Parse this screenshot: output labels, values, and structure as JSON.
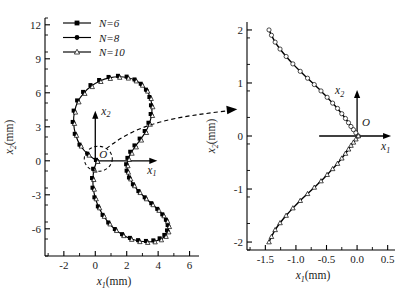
{
  "figure": {
    "kind": "two-panel-trajectory-plot",
    "panels": [
      "left-full-orbit",
      "right-zoom-detail"
    ],
    "callout": {
      "name": "zoom-callout",
      "description": "dashed ellipse around origin in left panel with dashed arrow pointing to right panel"
    }
  },
  "legend": {
    "position": "top-left-inside",
    "entries": [
      {
        "label": "N=6",
        "marker": "filled-square",
        "color": "#000000"
      },
      {
        "label": "N=8",
        "marker": "filled-circle",
        "color": "#000000"
      },
      {
        "label": "N=10",
        "marker": "open-triangle",
        "color": "#000000"
      }
    ]
  },
  "left_panel": {
    "xlabel": "x",
    "xlabel_sub": "1",
    "xlabel_unit": "(mm)",
    "ylabel": "x",
    "ylabel_sub": "2",
    "ylabel_unit": "(mm)",
    "xticks": [
      "-2",
      "0",
      "2",
      "4",
      "6"
    ],
    "yticks": [
      "12",
      "9",
      "6",
      "3",
      "0",
      "-3",
      "-6"
    ],
    "origin_label": "O",
    "inner_axis_x": "x",
    "inner_axis_x_sub": "1",
    "inner_axis_y": "x",
    "inner_axis_y_sub": "2"
  },
  "right_panel": {
    "xlabel": "x",
    "xlabel_sub": "1",
    "xlabel_unit": "(mm)",
    "ylabel": "x",
    "ylabel_sub": "2",
    "ylabel_unit": "(mm)",
    "xticks": [
      "-1.5",
      "-1.0",
      "-0.5",
      "0.0",
      "0.5"
    ],
    "yticks": [
      "2",
      "1",
      "0",
      "-1",
      "-2"
    ],
    "origin_label": "O",
    "inner_axis_x": "x",
    "inner_axis_x_sub": "1",
    "inner_axis_y": "x",
    "inner_axis_y_sub": "2"
  },
  "chart_data": [
    {
      "type": "line",
      "name": "left-full-orbit",
      "title": "",
      "xlabel": "x1 (mm)",
      "ylabel": "x2 (mm)",
      "xlim": [
        -3.2,
        6.6
      ],
      "ylim": [
        -8.4,
        12.6
      ],
      "xticks": [
        -2,
        0,
        2,
        4,
        6
      ],
      "yticks": [
        12,
        9,
        6,
        3,
        0,
        -3,
        -6
      ],
      "xminor_step": 1,
      "yminor_step": 1.5,
      "grid": false,
      "legend": [
        "N=6",
        "N=8",
        "N=10"
      ],
      "legend_position": "upper-left",
      "curve_shape": "figure-eight (lemniscate-like) closed orbit crossing near origin",
      "series": [
        {
          "name": "N=6",
          "marker": "filled-square",
          "x": [
            0.1,
            -0.45,
            -0.95,
            -1.25,
            -1.38,
            -1.32,
            -1.1,
            -0.72,
            -0.25,
            0.3,
            0.9,
            1.5,
            2.05,
            2.55,
            2.95,
            3.28,
            3.5,
            3.6,
            3.58,
            3.44,
            3.2,
            2.88,
            2.55,
            2.28,
            2.1,
            2.02,
            2.05,
            2.2,
            2.45,
            2.8,
            3.2,
            3.62,
            4.0,
            4.32,
            4.55,
            4.66,
            4.62,
            4.45,
            4.15,
            3.75,
            3.28,
            2.78,
            2.26,
            1.76,
            1.3,
            0.88,
            0.52,
            0.22,
            0.0,
            -0.12,
            -0.15,
            -0.08,
            0.1
          ],
          "y": [
            0.0,
            0.55,
            1.35,
            2.3,
            3.35,
            4.35,
            5.25,
            6.0,
            6.6,
            7.05,
            7.32,
            7.42,
            7.35,
            7.1,
            6.72,
            6.2,
            5.55,
            4.82,
            4.05,
            3.28,
            2.55,
            1.88,
            1.28,
            0.72,
            0.18,
            -0.38,
            -0.95,
            -1.55,
            -2.15,
            -2.75,
            -3.3,
            -3.82,
            -4.32,
            -4.8,
            -5.28,
            -5.75,
            -6.22,
            -6.62,
            -6.92,
            -7.1,
            -7.15,
            -7.08,
            -6.88,
            -6.55,
            -6.1,
            -5.52,
            -4.85,
            -4.1,
            -3.3,
            -2.45,
            -1.6,
            -0.78,
            0.0
          ]
        },
        {
          "name": "N=8",
          "marker": "filled-circle",
          "x": [
            0.1,
            -0.45,
            -0.95,
            -1.25,
            -1.38,
            -1.32,
            -1.1,
            -0.72,
            -0.25,
            0.3,
            0.9,
            1.5,
            2.05,
            2.55,
            2.95,
            3.28,
            3.5,
            3.6,
            3.58,
            3.44,
            3.2,
            2.88,
            2.55,
            2.28,
            2.1,
            2.02,
            2.05,
            2.2,
            2.45,
            2.8,
            3.2,
            3.62,
            4.0,
            4.32,
            4.55,
            4.66,
            4.62,
            4.45,
            4.15,
            3.75,
            3.28,
            2.78,
            2.26,
            1.76,
            1.3,
            0.88,
            0.52,
            0.22,
            0.0,
            -0.12,
            -0.15,
            -0.08,
            0.1
          ],
          "y": [
            0.0,
            0.55,
            1.35,
            2.3,
            3.35,
            4.35,
            5.25,
            6.0,
            6.6,
            7.05,
            7.32,
            7.42,
            7.35,
            7.1,
            6.72,
            6.2,
            5.55,
            4.82,
            4.05,
            3.28,
            2.55,
            1.88,
            1.28,
            0.72,
            0.18,
            -0.38,
            -0.95,
            -1.55,
            -2.15,
            -2.75,
            -3.3,
            -3.82,
            -4.32,
            -4.8,
            -5.28,
            -5.75,
            -6.22,
            -6.62,
            -6.92,
            -7.1,
            -7.15,
            -7.08,
            -6.88,
            -6.55,
            -6.1,
            -5.52,
            -4.85,
            -4.1,
            -3.3,
            -2.45,
            -1.6,
            -0.78,
            0.0
          ]
        },
        {
          "name": "N=10",
          "marker": "open-triangle",
          "x": [
            0.1,
            -0.45,
            -0.95,
            -1.25,
            -1.38,
            -1.32,
            -1.1,
            -0.72,
            -0.25,
            0.3,
            0.9,
            1.5,
            2.05,
            2.55,
            2.95,
            3.28,
            3.5,
            3.6,
            3.58,
            3.44,
            3.2,
            2.88,
            2.55,
            2.28,
            2.1,
            2.02,
            2.05,
            2.2,
            2.45,
            2.8,
            3.2,
            3.62,
            4.0,
            4.32,
            4.55,
            4.66,
            4.62,
            4.45,
            4.15,
            3.75,
            3.28,
            2.78,
            2.26,
            1.76,
            1.3,
            0.88,
            0.52,
            0.22,
            0.0,
            -0.12,
            -0.15,
            -0.08,
            0.1
          ],
          "y": [
            0.0,
            0.55,
            1.35,
            2.3,
            3.35,
            4.35,
            5.25,
            6.0,
            6.6,
            7.05,
            7.32,
            7.42,
            7.35,
            7.1,
            6.72,
            6.2,
            5.55,
            4.82,
            4.05,
            3.28,
            2.55,
            1.88,
            1.28,
            0.72,
            0.18,
            -0.38,
            -0.95,
            -1.55,
            -2.15,
            -2.75,
            -3.3,
            -3.82,
            -4.32,
            -4.8,
            -5.28,
            -5.75,
            -6.22,
            -6.62,
            -6.92,
            -7.1,
            -7.15,
            -7.08,
            -6.88,
            -6.55,
            -6.1,
            -5.52,
            -4.85,
            -4.1,
            -3.3,
            -2.45,
            -1.6,
            -0.78,
            0.0
          ]
        }
      ]
    },
    {
      "type": "line",
      "name": "right-zoom-detail",
      "title": "",
      "xlabel": "x1 (mm)",
      "ylabel": "x2 (mm)",
      "xlim": [
        -1.8,
        0.62
      ],
      "ylim": [
        -2.15,
        2.15
      ],
      "xticks": [
        -1.5,
        -1.0,
        -0.5,
        0.0,
        0.5
      ],
      "yticks": [
        2,
        1,
        0,
        -1,
        -2
      ],
      "xminor_step": 0.25,
      "yminor_step": 0.5,
      "grid": false,
      "legend": [],
      "curve_shape": "symmetric cusp opening leftward, vertex at origin",
      "series": [
        {
          "name": "upper-branch",
          "marker": "open-circle",
          "x": [
            0.02,
            -0.02,
            -0.06,
            -0.1,
            -0.14,
            -0.19,
            -0.25,
            -0.32,
            -0.4,
            -0.49,
            -0.59,
            -0.7,
            -0.81,
            -0.93,
            -1.05,
            -1.16,
            -1.26,
            -1.34,
            -1.4,
            -1.44
          ],
          "y": [
            0.0,
            0.06,
            0.12,
            0.18,
            0.25,
            0.33,
            0.42,
            0.52,
            0.62,
            0.73,
            0.85,
            0.97,
            1.09,
            1.22,
            1.36,
            1.5,
            1.64,
            1.77,
            1.9,
            2.0
          ]
        },
        {
          "name": "lower-branch",
          "marker": "open-triangle",
          "x": [
            0.02,
            -0.02,
            -0.06,
            -0.1,
            -0.14,
            -0.19,
            -0.25,
            -0.32,
            -0.4,
            -0.49,
            -0.59,
            -0.7,
            -0.81,
            -0.93,
            -1.05,
            -1.16,
            -1.26,
            -1.34,
            -1.4,
            -1.44
          ],
          "y": [
            0.0,
            -0.06,
            -0.12,
            -0.18,
            -0.25,
            -0.33,
            -0.42,
            -0.52,
            -0.62,
            -0.73,
            -0.85,
            -0.97,
            -1.09,
            -1.22,
            -1.36,
            -1.5,
            -1.64,
            -1.77,
            -1.9,
            -2.0
          ]
        }
      ]
    }
  ]
}
